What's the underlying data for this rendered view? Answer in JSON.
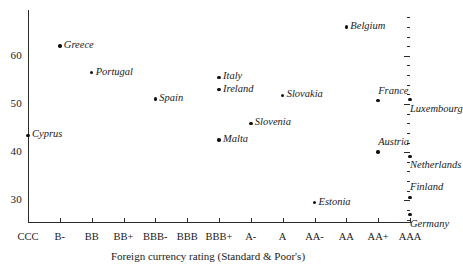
{
  "chart_data": {
    "type": "scatter",
    "title": "",
    "xlabel": "Foreign currency rating (Standard & Poor's)",
    "ylabel": "",
    "grid": false,
    "legend": "none",
    "xlim": [
      0,
      12
    ],
    "ylim": [
      25.5,
      69.5
    ],
    "x_tick_labels": [
      "CCC",
      "B-",
      "BB",
      "BB+",
      "BBB-",
      "BBB",
      "BBB+",
      "A-",
      "A",
      "AA-",
      "AA",
      "AA+",
      "AAA"
    ],
    "y_tick_labels": [
      "30",
      "40",
      "50",
      "60"
    ],
    "y_tick_values": [
      30,
      40,
      50,
      60
    ],
    "y_minor_tick_step": 2,
    "points": [
      {
        "name": "Cyprus",
        "rating": "CCC",
        "x": 0,
        "y": 43.5,
        "label_pos": "right"
      },
      {
        "name": "Greece",
        "rating": "B-",
        "x": 1,
        "y": 62.0,
        "label_pos": "right"
      },
      {
        "name": "Portugal",
        "rating": "BB",
        "x": 2,
        "y": 56.5,
        "label_pos": "right"
      },
      {
        "name": "Spain",
        "rating": "BBB-",
        "x": 4,
        "y": 51.0,
        "label_pos": "right"
      },
      {
        "name": "Italy",
        "rating": "BBB+",
        "x": 6,
        "y": 55.5,
        "label_pos": "right"
      },
      {
        "name": "Ireland",
        "rating": "BBB+",
        "x": 6,
        "y": 53.0,
        "label_pos": "right"
      },
      {
        "name": "Malta",
        "rating": "BBB+",
        "x": 6,
        "y": 42.5,
        "label_pos": "right"
      },
      {
        "name": "Slovenia",
        "rating": "A-",
        "x": 7,
        "y": 46.0,
        "label_pos": "right"
      },
      {
        "name": "Slovakia",
        "rating": "A",
        "x": 8,
        "y": 51.8,
        "label_pos": "right"
      },
      {
        "name": "Estonia",
        "rating": "AA-",
        "x": 9,
        "y": 29.5,
        "label_pos": "right"
      },
      {
        "name": "Belgium",
        "rating": "AA",
        "x": 10,
        "y": 66.0,
        "label_pos": "right"
      },
      {
        "name": "France",
        "rating": "AA+",
        "x": 11,
        "y": 50.7,
        "label_pos": "above"
      },
      {
        "name": "Austria",
        "rating": "AA+",
        "x": 11,
        "y": 40.0,
        "label_pos": "above"
      },
      {
        "name": "Luxembourg",
        "rating": "AAA",
        "x": 12,
        "y": 50.9,
        "label_pos": "below"
      },
      {
        "name": "Netherlands",
        "rating": "AAA",
        "x": 12,
        "y": 39.1,
        "label_pos": "below"
      },
      {
        "name": "Finland",
        "rating": "AAA",
        "x": 12,
        "y": 30.6,
        "label_pos": "above"
      },
      {
        "name": "Germany",
        "rating": "AAA",
        "x": 12,
        "y": 27.0,
        "label_pos": "below"
      }
    ]
  }
}
